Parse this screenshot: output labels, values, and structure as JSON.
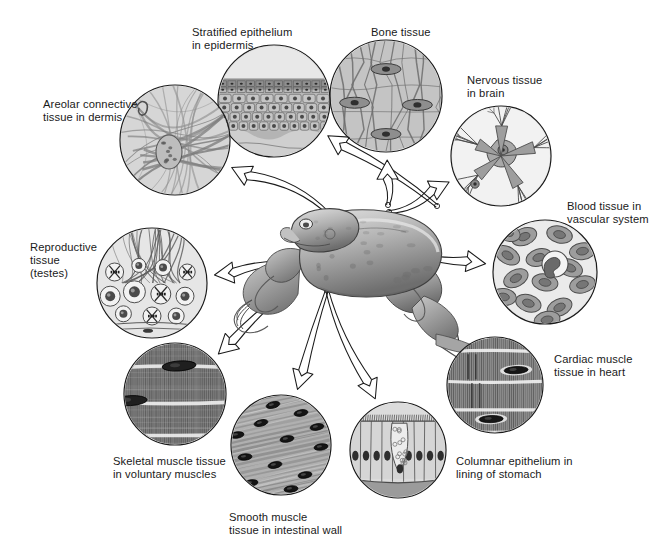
{
  "figure": {
    "background_color": "#ffffff",
    "ink_color": "#1a1a1a",
    "label_font_size_px": 11.2
  },
  "center_organism": {
    "name": "frog",
    "fill_light": "#cfcfcf",
    "fill_mid": "#9a9a9a",
    "fill_dark": "#5e5e5e"
  },
  "tissues": [
    {
      "id": "stratified-epithelium",
      "label_lines": [
        "Stratified epithelium",
        "in epidermis"
      ],
      "label_x": 192,
      "label_y": 26,
      "circle_cx": 274,
      "circle_cy": 101,
      "circle_r": 56,
      "origin_x": 437,
      "origin_y": 206,
      "tissue_type": "stratified-epithelium",
      "tone": "#b4b4b4"
    },
    {
      "id": "bone-tissue",
      "label_lines": [
        "Bone tissue"
      ],
      "label_x": 371,
      "label_y": 26,
      "circle_cx": 386,
      "circle_cy": 96,
      "circle_r": 56,
      "origin_x": 388,
      "origin_y": 205,
      "tissue_type": "bone",
      "tone": "#bdbdbd"
    },
    {
      "id": "nervous-tissue",
      "label_lines": [
        "Nervous tissue",
        "in brain"
      ],
      "label_x": 467,
      "label_y": 74,
      "circle_cx": 501,
      "circle_cy": 156,
      "circle_r": 50,
      "origin_x": 389,
      "origin_y": 212,
      "tissue_type": "nervous",
      "tone": "#c9c9c9"
    },
    {
      "id": "blood-tissue",
      "label_lines": [
        "Blood tissue in",
        "vascular system"
      ],
      "label_x": 567,
      "label_y": 200,
      "circle_cx": 545,
      "circle_cy": 272,
      "circle_r": 52,
      "origin_x": 415,
      "origin_y": 254,
      "tissue_type": "blood",
      "tone": "#c6c6c6"
    },
    {
      "id": "cardiac-muscle",
      "label_lines": [
        "Cardiac muscle",
        "tissue in heart"
      ],
      "label_x": 554,
      "label_y": 353,
      "circle_cx": 495,
      "circle_cy": 385,
      "circle_r": 48,
      "origin_x": 400,
      "origin_y": 272,
      "tissue_type": "cardiac",
      "tone": "#8c8c8c"
    },
    {
      "id": "columnar-epithelium",
      "label_lines": [
        "Columnar epithelium in",
        "lining of stomach"
      ],
      "label_x": 456,
      "label_y": 455,
      "circle_cx": 398,
      "circle_cy": 450,
      "circle_r": 48,
      "origin_x": 327,
      "origin_y": 290,
      "tissue_type": "columnar-epithelium",
      "tone": "#d2d2d2"
    },
    {
      "id": "smooth-muscle",
      "label_lines": [
        "Smooth muscle",
        "tissue in intestinal wall"
      ],
      "label_x": 229,
      "label_y": 511,
      "circle_cx": 281,
      "circle_cy": 445,
      "circle_r": 50,
      "origin_x": 327,
      "origin_y": 290,
      "tissue_type": "smooth-muscle",
      "tone": "#a8a8a8"
    },
    {
      "id": "skeletal-muscle",
      "label_lines": [
        "Skeletal muscle tissue",
        "in voluntary muscles"
      ],
      "label_x": 113,
      "label_y": 455,
      "circle_cx": 175,
      "circle_cy": 394,
      "circle_r": 51,
      "origin_x": 290,
      "origin_y": 288,
      "tissue_type": "skeletal-muscle",
      "tone": "#7d7d7d"
    },
    {
      "id": "reproductive-tissue",
      "label_lines": [
        "Reproductive",
        "tissue",
        "(testes)"
      ],
      "label_x": 30,
      "label_y": 241,
      "circle_cx": 152,
      "circle_cy": 283,
      "circle_r": 55,
      "origin_x": 300,
      "origin_y": 264,
      "tissue_type": "reproductive",
      "tone": "#d8d8d8"
    },
    {
      "id": "areolar-connective",
      "label_lines": [
        "Areolar connective",
        "tissue in dermis"
      ],
      "label_x": 43,
      "label_y": 98,
      "circle_cx": 175,
      "circle_cy": 140,
      "circle_r": 55,
      "origin_x": 330,
      "origin_y": 215,
      "tissue_type": "areolar",
      "tone": "#cdcdcd"
    }
  ]
}
